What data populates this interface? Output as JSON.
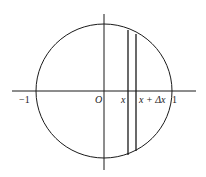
{
  "diagram": {
    "labels": {
      "minus_one": "−1",
      "origin": "O",
      "x": "x",
      "x_plus_dx": "x + Δx",
      "one": "1"
    },
    "colors": {
      "stroke": "#1a1a1a",
      "background": "#ffffff"
    }
  }
}
